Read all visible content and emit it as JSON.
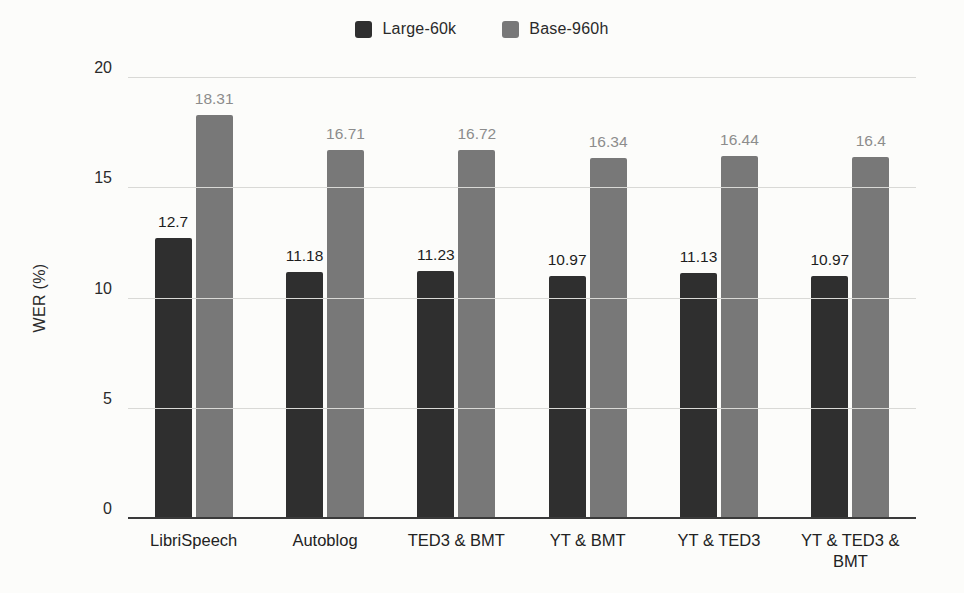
{
  "chart_data": {
    "type": "bar",
    "title": "",
    "ylabel": "WER (%)",
    "xlabel": "",
    "ylim": [
      0,
      20
    ],
    "yticks": [
      0,
      5,
      10,
      15,
      20
    ],
    "grid": true,
    "legend_position": "top",
    "categories": [
      "LibriSpeech",
      "Autoblog",
      "TED3 & BMT",
      "YT & BMT",
      "YT & TED3",
      "YT & TED3 & BMT"
    ],
    "series": [
      {
        "name": "Large-60k",
        "color": "#2f2f2f",
        "label_color": "#1d1d1d",
        "values": [
          12.7,
          11.18,
          11.23,
          10.97,
          11.13,
          10.97
        ]
      },
      {
        "name": "Base-960h",
        "color": "#787878",
        "label_color": "#8c8c8c",
        "values": [
          18.31,
          16.71,
          16.72,
          16.34,
          16.44,
          16.4
        ]
      }
    ]
  },
  "colors": {
    "background": "#fcfcfa",
    "gridline": "#d9d9d6",
    "axis_line": "#3a3a3a",
    "tick_text": "#2a2a2a"
  }
}
